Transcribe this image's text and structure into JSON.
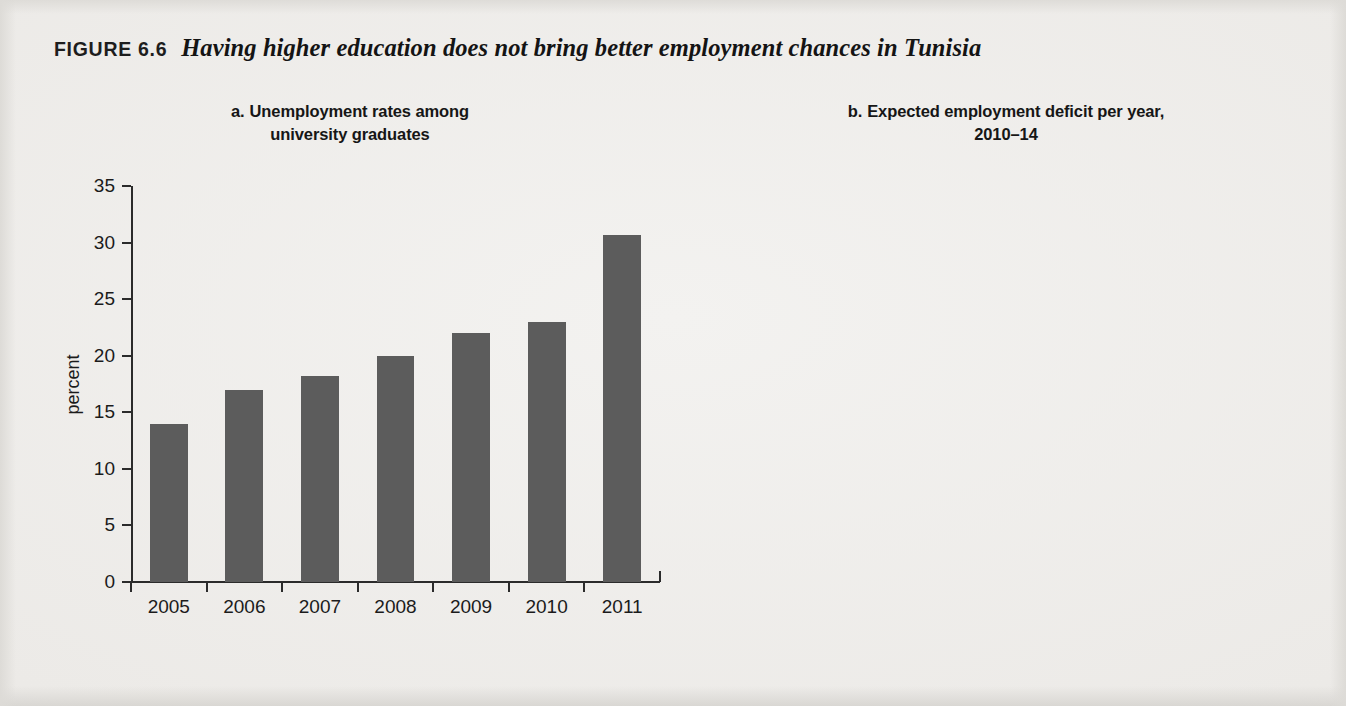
{
  "figure": {
    "number": "FIGURE 6.6",
    "title": "Having higher education does not bring better employment chances in Tunisia"
  },
  "colors": {
    "background": "#eceae7",
    "bar_panel_a": "#5c5c5c",
    "bar_panel_b": "#181818",
    "axis": "#2b2b2b",
    "text": "#1b1b1b"
  },
  "panel_a": {
    "label": "a.",
    "title_line1": "Unemployment rates among",
    "title_line2": "university graduates"
  },
  "panel_b": {
    "label": "b.",
    "title_line1": "Expected employment deficit per year,",
    "title_line2": "2010–14"
  },
  "chart_data": [
    {
      "type": "bar",
      "panel": "a.",
      "title": "Unemployment rates among university graduates",
      "xlabel": "",
      "ylabel": "percent",
      "categories": [
        "2005",
        "2006",
        "2007",
        "2008",
        "2009",
        "2010",
        "2011"
      ],
      "values": [
        14.0,
        17.0,
        18.2,
        20.0,
        22.0,
        23.0,
        30.7
      ],
      "ylim": [
        0,
        35
      ],
      "yticks": [
        0,
        5,
        10,
        15,
        20,
        25,
        30,
        35
      ],
      "ytick_labels": [
        "0",
        "5",
        "10",
        "15",
        "20",
        "25",
        "30",
        "35"
      ],
      "grid": false,
      "legend": "none",
      "bar_color": "#5c5c5c"
    },
    {
      "type": "bar",
      "panel": "b.",
      "title": "Expected employment deficit per year, 2010–14",
      "xlabel": "",
      "ylabel": "percent",
      "categories": [
        "primary",
        "basic",
        "secondary and vocational",
        "tertiary"
      ],
      "category_lines": [
        [
          "primary"
        ],
        [
          "basic"
        ],
        [
          "secondary",
          "and",
          "vocational"
        ],
        [
          "tertiary"
        ]
      ],
      "values": [
        6.0,
        -2.2,
        -1.3,
        27.0
      ],
      "ylim": [
        -5,
        30
      ],
      "yticks": [
        -5,
        0,
        5,
        10,
        15,
        20,
        25,
        30
      ],
      "ytick_labels": [
        "–5",
        "0",
        "5",
        "10",
        "15",
        "20",
        "25",
        "30"
      ],
      "grid": false,
      "legend": "none",
      "bar_color": "#181818"
    }
  ]
}
